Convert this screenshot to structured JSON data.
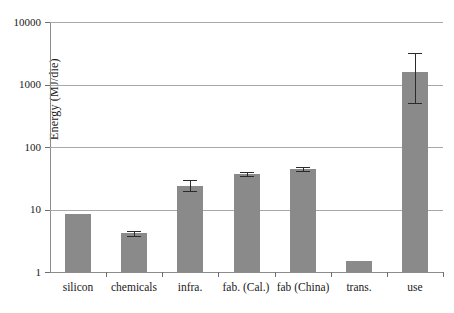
{
  "chart_data": {
    "type": "bar",
    "title": "",
    "xlabel": "",
    "ylabel": "Energy (MJ/die)",
    "yscale": "log",
    "ylim": [
      1,
      10000
    ],
    "ytick_labels": [
      "1",
      "10",
      "100",
      "1000",
      "10000"
    ],
    "ytick_values": [
      1,
      10,
      100,
      1000,
      10000
    ],
    "grid": true,
    "legend": "none",
    "categories": [
      "silicon",
      "chemicals",
      "infra.",
      "fab. (Cal.)",
      "fab (China)",
      "trans.",
      "use"
    ],
    "values": [
      8.5,
      4.2,
      24,
      37,
      45,
      1.5,
      1600
    ],
    "err_low": [
      0,
      3.8,
      20,
      34,
      42,
      0,
      500
    ],
    "err_high": [
      0,
      4.6,
      30,
      40,
      48,
      0,
      3200
    ],
    "bar_color": "#8a8a8a",
    "errorbar_color": "#2b2b2b",
    "gridline_color": "#a8a8a8",
    "axis_color": "#8c8c8c",
    "background": "#ffffff"
  }
}
